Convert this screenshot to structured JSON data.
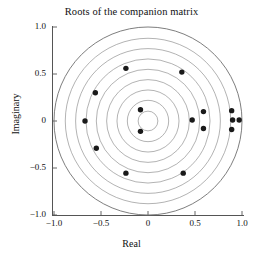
{
  "chart_data": {
    "type": "scatter",
    "title": "Roots of the companion matrix",
    "xlabel": "Real",
    "ylabel": "Imaginary",
    "xlim": [
      -1.15,
      1.15
    ],
    "ylim": [
      -1.15,
      1.15
    ],
    "grid": false,
    "aspect": "equal",
    "xticks": [
      -1.0,
      -0.5,
      0,
      0.5,
      1.0
    ],
    "xticklabels": [
      "−1.0",
      "−0.5",
      "0",
      "0.5",
      "1.0"
    ],
    "yticks": [
      -1.0,
      -0.5,
      0,
      0.5,
      1.0
    ],
    "yticklabels": [
      "−1.0",
      "−0.5",
      "0",
      "0.5",
      "1.0"
    ],
    "legend": null,
    "marker": "filled-circle",
    "marker_color": "#1a1a1a",
    "marker_size": 4.2,
    "circle_color": "#8a8a8a",
    "axis_color": "#555555",
    "points": [
      {
        "x": -0.235,
        "y": 0.56
      },
      {
        "x": 0.36,
        "y": 0.52
      },
      {
        "x": -0.56,
        "y": 0.3
      },
      {
        "x": -0.67,
        "y": 0.0
      },
      {
        "x": -0.55,
        "y": -0.29
      },
      {
        "x": -0.235,
        "y": -0.555
      },
      {
        "x": 0.375,
        "y": -0.555
      },
      {
        "x": -0.08,
        "y": 0.12
      },
      {
        "x": -0.08,
        "y": -0.11
      },
      {
        "x": 0.47,
        "y": 0.01
      },
      {
        "x": 0.59,
        "y": 0.1
      },
      {
        "x": 0.59,
        "y": -0.08
      },
      {
        "x": 0.89,
        "y": 0.11
      },
      {
        "x": 0.9,
        "y": 0.01
      },
      {
        "x": 0.97,
        "y": 0.01
      },
      {
        "x": 0.89,
        "y": -0.09
      }
    ],
    "circles": {
      "center": [
        0,
        0
      ],
      "radii": [
        0.105,
        0.22,
        0.33,
        0.44,
        0.55,
        0.66,
        0.77,
        0.88,
        1.0
      ]
    }
  },
  "axes": {
    "x_tick_labels": [
      "−1.0",
      "−0.5",
      "0",
      "0.5",
      "1.0"
    ],
    "y_tick_labels": [
      "1.0",
      "0.5",
      "0",
      "−0.5",
      "−1.0"
    ]
  }
}
